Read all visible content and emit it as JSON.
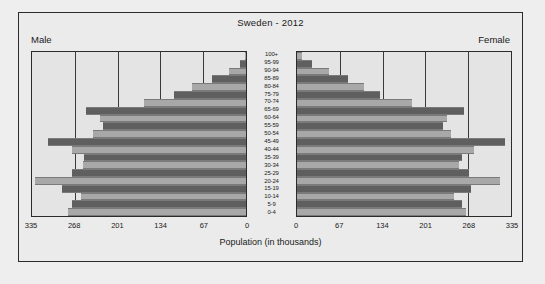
{
  "figure": {
    "title": "Sweden - 2012",
    "male_label": "Male",
    "female_label": "Female",
    "xlabel": "Population (in thousands)"
  },
  "chart_data": {
    "type": "bar",
    "subtype": "population-pyramid",
    "title": "Sweden - 2012",
    "xlabel": "Population (in thousands)",
    "ylabel": "",
    "categories": [
      "100+",
      "95-99",
      "90-94",
      "85-89",
      "80-84",
      "75-79",
      "70-74",
      "65-69",
      "60-64",
      "55-59",
      "50-54",
      "45-49",
      "40-44",
      "35-39",
      "30-34",
      "25-29",
      "20-24",
      "15-19",
      "10-14",
      "5-9",
      "0-4"
    ],
    "xticks": [
      0,
      67,
      134,
      201,
      268,
      335
    ],
    "xlim": [
      0,
      335
    ],
    "grid": true,
    "legend": "none",
    "series": [
      {
        "name": "Male",
        "side": "left",
        "values": [
          2,
          10,
          27,
          53,
          85,
          113,
          160,
          250,
          228,
          224,
          239,
          310,
          272,
          254,
          255,
          273,
          330,
          288,
          258,
          272,
          278
        ]
      },
      {
        "name": "Female",
        "side": "right",
        "values": [
          8,
          24,
          50,
          80,
          105,
          130,
          180,
          262,
          235,
          228,
          241,
          325,
          277,
          258,
          253,
          270,
          318,
          272,
          245,
          259,
          264
        ]
      }
    ]
  },
  "colors": {
    "bar_light": "#a8a8a8",
    "bar_dark": "#5f5f5f",
    "plot_background": "#e4e4e4",
    "figure_background": "#ebebeb",
    "page_background": "#eeeeee",
    "frame": "#2b2b2b"
  }
}
